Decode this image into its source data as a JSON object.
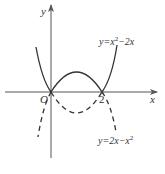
{
  "figure": {
    "type": "function-graph",
    "axes": {
      "x_label": "x",
      "y_label": "y",
      "origin_label": "O",
      "tick_labels": [
        {
          "value": 2,
          "label": "2"
        }
      ]
    },
    "curves": [
      {
        "name": "upward-parabola",
        "label_prefix": "y=x",
        "label_exp": "2",
        "label_suffix": "−2x",
        "equation": "y = x^2 - 2x",
        "roots": [
          0,
          2
        ],
        "vertex": [
          1,
          -1
        ],
        "style_outside_0_2": "solid",
        "style_inside_0_2": "dashed"
      },
      {
        "name": "downward-parabola",
        "label_prefix": "y=2x−x",
        "label_exp": "2",
        "label_suffix": "",
        "equation": "y = 2x - x^2",
        "roots": [
          0,
          2
        ],
        "vertex": [
          1,
          1
        ],
        "style_inside_0_2": "solid",
        "style_outside_0_2": "dashed"
      }
    ],
    "colors": {
      "stroke": "#333333",
      "axis": "#555555",
      "background": "#ffffff"
    }
  }
}
